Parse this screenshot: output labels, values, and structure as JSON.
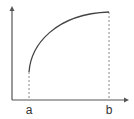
{
  "diagram": {
    "type": "function-graph",
    "labels": {
      "a": "a",
      "b": "b"
    },
    "colors": {
      "axis": "#555555",
      "curve": "#444444",
      "dashed": "#888888",
      "background": "#ffffff"
    }
  }
}
